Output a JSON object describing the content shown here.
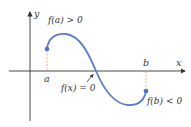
{
  "diagram": {
    "type": "function-graph-intermediate-value",
    "axes": {
      "x_label": "x",
      "y_label": "y"
    },
    "points": {
      "a_label": "a",
      "b_label": "b"
    },
    "annotations": {
      "fa": "f(a) > 0",
      "fb": "f(b) < 0",
      "root": "f(x) = 0"
    },
    "colors": {
      "curve": "#5b7fc4",
      "dot": "#4a72c0",
      "dashed": "#e8a0a0",
      "axis": "#333333"
    }
  }
}
